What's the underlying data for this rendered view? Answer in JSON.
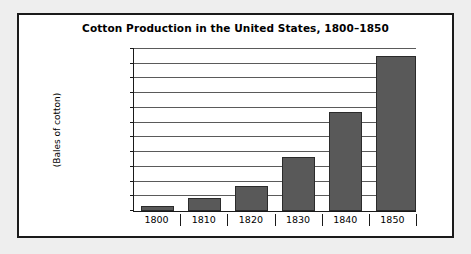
{
  "figure": {
    "title": "Cotton Production in the United States, 1800–1850",
    "y_axis_title": "(Bales of cotton)",
    "frame_color": "#1a1a1a",
    "background": "#ffffff",
    "page_background": "#eeeeee",
    "bar_color": "#595959",
    "bar_edge_color": "#2b2b2b",
    "gridline_color": "#5a5a5a"
  },
  "chart_data": {
    "type": "bar",
    "title": "Cotton Production in the United States, 1800–1850",
    "xlabel": "",
    "ylabel": "(Bales of cotton)",
    "categories": [
      "1800",
      "1810",
      "1820",
      "1830",
      "1840",
      "1850"
    ],
    "values": [
      73000,
      178000,
      335000,
      732000,
      1347000,
      2100000
    ],
    "ylim": [
      0,
      2200000
    ],
    "ytick_values": [
      0,
      400000,
      800000,
      1200000,
      1600000,
      2000000
    ],
    "ytick_labels": [
      "0",
      "400,000",
      "800,000",
      "1,200,000",
      "1,600,000",
      "2,000,000"
    ],
    "minor_tick_interval": 200000,
    "gridlines": [
      200000,
      400000,
      600000,
      800000,
      1000000,
      1200000,
      1400000,
      1600000,
      1800000,
      2000000,
      2200000
    ],
    "grid": true,
    "legend": null
  }
}
